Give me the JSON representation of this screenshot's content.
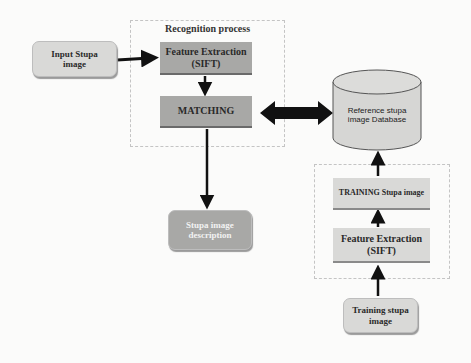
{
  "recognition_group": {
    "title": "Recognition process"
  },
  "nodes": {
    "input": "Input Stupa\nimage",
    "feature_extraction": "Feature Extraction\n(SIFT)",
    "matching": "MATCHING",
    "description": "Stupa image\ndescription",
    "database": "Reference stupa\nimage Database",
    "training_stupa": "TRAINING Stupa image",
    "training_feature": "Feature Extraction\n(SIFT)",
    "training_input": "Training stupa\nimage"
  },
  "colors": {
    "light_box": "#d9d9d7",
    "dark_box": "#a8a8a6",
    "arrow": "#111111",
    "dotted_border": "#c4c4c4"
  }
}
